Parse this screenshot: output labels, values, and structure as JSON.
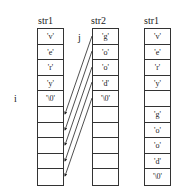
{
  "diagram": {
    "columns": [
      {
        "title": "str1",
        "cells": [
          "'v'",
          "'e'",
          "'r'",
          "'y'",
          "'\\0'",
          "",
          "",
          "",
          "",
          ""
        ]
      },
      {
        "title": "str2",
        "cells": [
          "'g'",
          "'o'",
          "'o'",
          "'d'",
          "'\\0'",
          "",
          "",
          "",
          "",
          ""
        ]
      },
      {
        "title": "str1",
        "cells": [
          "'v'",
          "'e'",
          "'r'",
          "'y'",
          "",
          "'g'",
          "'o'",
          "'o'",
          "'d'",
          "'\\0'"
        ]
      }
    ],
    "index_labels": {
      "i": "i",
      "j": "j"
    },
    "arrows": "str2[0..4] copied into str1[4..8]"
  }
}
